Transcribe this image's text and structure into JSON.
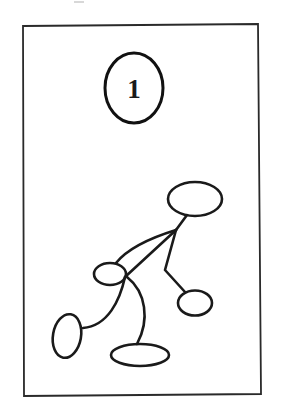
{
  "figure": {
    "panel_number": "1",
    "colors": {
      "ink": "#1a1a1a",
      "background": "#ffffff"
    },
    "parts": [
      {
        "name": "head",
        "shape": "ellipse"
      },
      {
        "name": "right-hand",
        "shape": "ellipse"
      },
      {
        "name": "left-hand",
        "shape": "ellipse"
      },
      {
        "name": "left-foot",
        "shape": "ellipse"
      },
      {
        "name": "right-foot",
        "shape": "ellipse"
      }
    ]
  }
}
